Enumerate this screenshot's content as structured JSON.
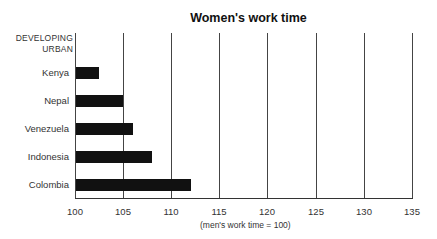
{
  "chart_data": {
    "type": "bar",
    "orientation": "horizontal",
    "title": "Women's work time",
    "group_label": [
      "DEVELOPING",
      "URBAN"
    ],
    "categories": [
      "Kenya",
      "Nepal",
      "Venezuela",
      "Indonesia",
      "Colombia"
    ],
    "values": [
      102.5,
      105,
      106,
      108,
      112
    ],
    "xlabel": "(men's work time = 100)",
    "ylabel": "",
    "xlim": [
      100,
      135
    ],
    "xticks": [
      "100",
      "105",
      "110",
      "115",
      "120",
      "125",
      "130",
      "135"
    ],
    "grid": true,
    "bar_color": "#111111"
  }
}
